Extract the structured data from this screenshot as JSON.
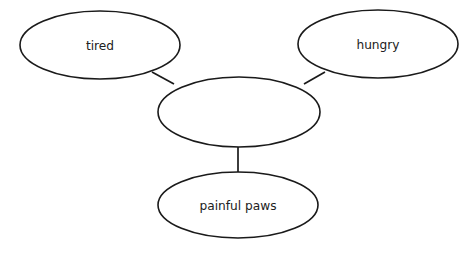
{
  "diagram": {
    "type": "concept-map",
    "title": "",
    "background_color": "#ffffff",
    "stroke_color": "#1a1a1a",
    "text_color": "#212121",
    "nodes": [
      {
        "id": "tired",
        "label": "tired",
        "cx": 100,
        "cy": 45,
        "rx": 80,
        "ry": 34
      },
      {
        "id": "hungry",
        "label": "hungry",
        "cx": 378,
        "cy": 44,
        "rx": 80,
        "ry": 34
      },
      {
        "id": "center",
        "label": "",
        "cx": 239,
        "cy": 112,
        "rx": 81,
        "ry": 35
      },
      {
        "id": "painful-paws",
        "label": "painful paws",
        "cx": 238,
        "cy": 205,
        "rx": 80,
        "ry": 33
      }
    ],
    "edges": [
      {
        "id": "edge-tired-center",
        "from": "tired",
        "to": "center",
        "x1": 152,
        "y1": 72,
        "x2": 174,
        "y2": 84
      },
      {
        "id": "edge-center-hungry",
        "from": "center",
        "to": "hungry",
        "x1": 304,
        "y1": 84,
        "x2": 325,
        "y2": 72
      },
      {
        "id": "edge-center-painful-paws",
        "from": "center",
        "to": "painful-paws",
        "x1": 238,
        "y1": 147,
        "x2": 238,
        "y2": 172
      }
    ]
  }
}
